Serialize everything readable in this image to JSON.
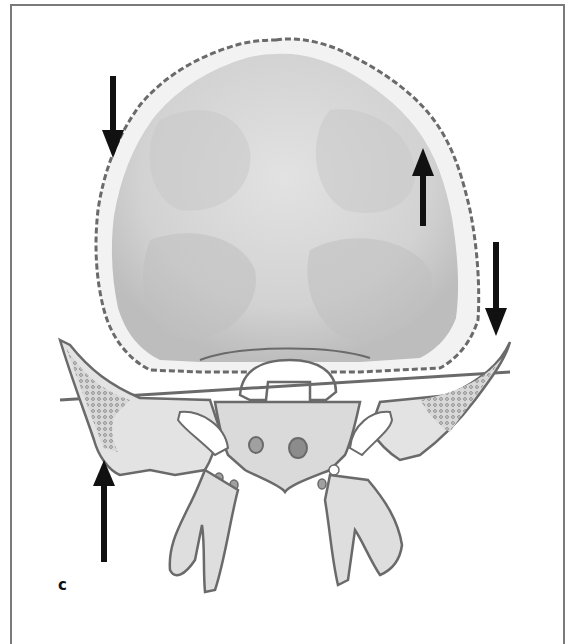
{
  "figure": {
    "panel_label": "c",
    "arrows": [
      {
        "id": "upper-left",
        "direction": "down"
      },
      {
        "id": "upper-right",
        "direction": "up"
      },
      {
        "id": "right-lateral",
        "direction": "down"
      },
      {
        "id": "lower-left",
        "direction": "up"
      }
    ],
    "colors": {
      "outline": "#6a6a6a",
      "bone_light": "#e6e6e6",
      "bone_mid": "#cfcfcf",
      "bone_dark": "#a8a8a8",
      "arrow": "#111111",
      "frame": "#7a7a7a"
    }
  }
}
